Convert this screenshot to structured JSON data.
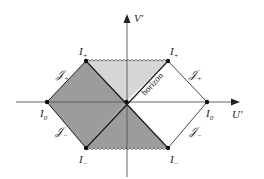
{
  "diagram": {
    "type": "penrose-diagram",
    "axes": {
      "vertical": {
        "label": "V",
        "prime": "′"
      },
      "horizontal": {
        "label": "U",
        "prime": "′"
      }
    },
    "points": {
      "top_left": {
        "label": "I",
        "sub": "+"
      },
      "top_right": {
        "label": "I",
        "sub": "+"
      },
      "left": {
        "label": "I",
        "sub": "0"
      },
      "right": {
        "label": "I",
        "sub": "0"
      },
      "bottom_left": {
        "label": "I",
        "sub": "−"
      },
      "bottom_right": {
        "label": "I",
        "sub": "−"
      }
    },
    "null_infinity": {
      "upper_left": {
        "label": "𝒥",
        "sub": "+"
      },
      "upper_right": {
        "label": "𝒥",
        "sub": "+"
      },
      "lower_left": {
        "label": "𝒥",
        "sub": "−"
      },
      "lower_right": {
        "label": "𝒥",
        "sub": "−"
      }
    },
    "horizon_label": "horizon",
    "colors": {
      "dark_region": "#9c9c9c",
      "light_region": "#d6d6d6",
      "lines": "#1a1a1a",
      "axis": "#555555"
    }
  }
}
